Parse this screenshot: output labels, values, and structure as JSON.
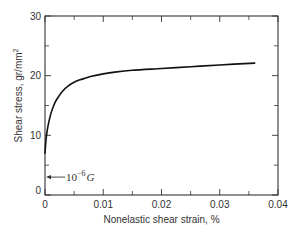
{
  "chart_data": {
    "type": "line",
    "title": "",
    "xlabel": "Nonelastic shear strain, %",
    "ylabel": "Shear stress, gr/mm",
    "ylabel_superscript": "2",
    "xlim": [
      0,
      0.04
    ],
    "ylim": [
      0,
      30
    ],
    "x_ticks": [
      0,
      0.01,
      0.02,
      0.03,
      0.04
    ],
    "x_tick_labels": [
      "0",
      "0.01",
      "0.02",
      "0.03",
      "0.04"
    ],
    "x_minor_ticks": [
      0.005,
      0.015,
      0.025,
      0.035
    ],
    "y_ticks": [
      0,
      10,
      20,
      30
    ],
    "y_tick_labels": [
      "0",
      "10",
      "20",
      "30"
    ],
    "y_minor_ticks": [
      5,
      15,
      25
    ],
    "grid": false,
    "series": [
      {
        "name": "Shear stress vs nonelastic shear strain",
        "x": [
          0,
          0.0002,
          0.0005,
          0.001,
          0.0015,
          0.002,
          0.003,
          0.004,
          0.005,
          0.006,
          0.007,
          0.008,
          0.01,
          0.012,
          0.015,
          0.02,
          0.025,
          0.03,
          0.036
        ],
        "y": [
          7,
          9.5,
          11.5,
          13.6,
          15.0,
          16.0,
          17.4,
          18.3,
          18.9,
          19.3,
          19.6,
          19.9,
          20.3,
          20.6,
          20.9,
          21.2,
          21.5,
          21.8,
          22.1
        ]
      }
    ],
    "annotations": [
      {
        "text_base": "10",
        "text_exp": "−6",
        "text_sym": "G",
        "points_to_y": 3,
        "arrow": "left"
      }
    ]
  }
}
